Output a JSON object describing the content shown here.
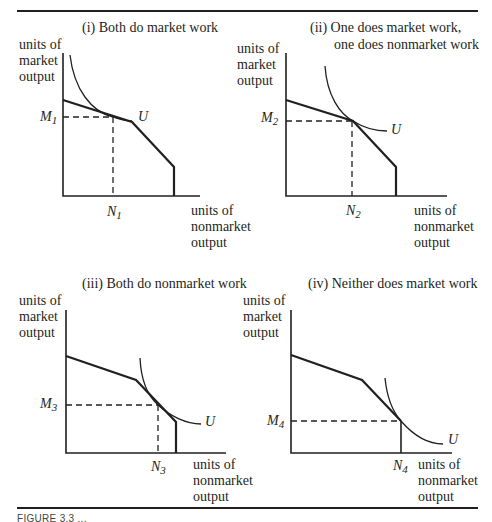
{
  "figure": {
    "caption_partial": "FIGURE 3.3  ...",
    "panels": [
      {
        "id": "i",
        "title_lines": [
          "(i) Both do market work"
        ],
        "y_axis_label": [
          "units of",
          "market",
          "output"
        ],
        "x_axis_label": [
          "units of",
          "nonmarket",
          "output"
        ],
        "m_label": "M",
        "m_sub": "1",
        "n_label": "N",
        "n_sub": "1",
        "curve_label": "U"
      },
      {
        "id": "ii",
        "title_lines": [
          "(ii) One does market work,",
          "one does nonmarket work"
        ],
        "y_axis_label": [
          "units of",
          "market",
          "output"
        ],
        "x_axis_label": [
          "units of",
          "nonmarket",
          "output"
        ],
        "m_label": "M",
        "m_sub": "2",
        "n_label": "N",
        "n_sub": "2",
        "curve_label": "U"
      },
      {
        "id": "iii",
        "title_lines": [
          "(iii) Both do nonmarket work"
        ],
        "y_axis_label": [
          "units of",
          "market",
          "output"
        ],
        "x_axis_label": [
          "units of",
          "nonmarket",
          "output"
        ],
        "m_label": "M",
        "m_sub": "3",
        "n_label": "N",
        "n_sub": "3",
        "curve_label": "U"
      },
      {
        "id": "iv",
        "title_lines": [
          "(iv) Neither does market work"
        ],
        "y_axis_label": [
          "units of",
          "market",
          "output"
        ],
        "x_axis_label": [
          "units of",
          "nonmarket",
          "output"
        ],
        "m_label": "M",
        "m_sub": "4",
        "n_label": "N",
        "n_sub": "4",
        "curve_label": "U"
      }
    ]
  }
}
